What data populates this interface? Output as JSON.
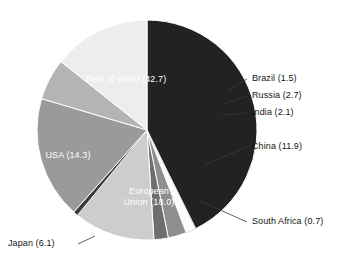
{
  "chart_data": {
    "type": "pie",
    "title": "",
    "cropped_header_text": "",
    "unit": "percent",
    "total": 100.0,
    "start_angle_deg": 0,
    "direction": "clockwise",
    "legend": "none",
    "labels_on_slices": true,
    "categories": [
      "Rest of world",
      "Brazil",
      "Russia",
      "India",
      "China",
      "South Africa",
      "European Union",
      "Japan",
      "USA"
    ],
    "values": [
      42.7,
      1.5,
      2.7,
      2.1,
      11.9,
      0.7,
      18.0,
      6.1,
      14.3
    ],
    "colors": [
      "#222222",
      "#fbfbfb",
      "#8e8e8e",
      "#6e6e6e",
      "#cdcdcd",
      "#3b3b3b",
      "#9a9a9a",
      "#b4b4b4",
      "#ededed"
    ],
    "slices": [
      {
        "name": "Rest of world",
        "value": 42.7,
        "display": "Rest of world (42.7)",
        "color": "#222222",
        "label_placement": "inside",
        "label_color": "#ffffff"
      },
      {
        "name": "Brazil",
        "value": 1.5,
        "display": "Brazil (1.5)",
        "color": "#fbfbfb",
        "label_placement": "leader",
        "label_color": "#141414"
      },
      {
        "name": "Russia",
        "value": 2.7,
        "display": "Russia (2.7)",
        "color": "#8e8e8e",
        "label_placement": "leader",
        "label_color": "#141414"
      },
      {
        "name": "India",
        "value": 2.1,
        "display": "India (2.1)",
        "color": "#6e6e6e",
        "label_placement": "leader",
        "label_color": "#141414"
      },
      {
        "name": "China",
        "value": 11.9,
        "display": "China (11.9)",
        "color": "#cdcdcd",
        "label_placement": "leader",
        "label_color": "#141414"
      },
      {
        "name": "South Africa",
        "value": 0.7,
        "display": "South Africa (0.7)",
        "color": "#3b3b3b",
        "label_placement": "leader",
        "label_color": "#141414"
      },
      {
        "name": "European Union",
        "value": 18.0,
        "display": "European Union (18.0)",
        "display_line1": "European",
        "display_line2": "Union (18.0)",
        "color": "#9a9a9a",
        "label_placement": "inside",
        "label_color": "#ffffff"
      },
      {
        "name": "Japan",
        "value": 6.1,
        "display": "Japan (6.1)",
        "color": "#b4b4b4",
        "label_placement": "leader",
        "label_color": "#141414"
      },
      {
        "name": "USA",
        "value": 14.3,
        "display": "USA (14.3)",
        "color": "#ededed",
        "label_placement": "inside",
        "label_color": "#fdfdfd"
      }
    ]
  },
  "labels": {
    "rest_of_world": "Rest of world (42.7)",
    "brazil": "Brazil (1.5)",
    "russia": "Russia (2.7)",
    "india": "India (2.1)",
    "china": "China (11.9)",
    "south_africa": "South Africa (0.7)",
    "eu_line1": "European",
    "eu_line2": "Union (18.0)",
    "japan": "Japan (6.1)",
    "usa": "USA (14.3)"
  }
}
